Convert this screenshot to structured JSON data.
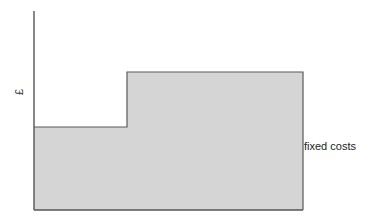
{
  "figure": {
    "background_color": "#ffffff",
    "width": 365,
    "height": 222
  },
  "axes": {
    "y_axis_label": "£",
    "x_axis_label": "",
    "axis_color": "#555555",
    "grid": "off",
    "ticks": []
  },
  "annotations": {
    "series_label": "fixed costs"
  },
  "style": {
    "fill_color": "#d5d5d5",
    "outline_color": "#5a5a5a",
    "text_color": "#1c1c1c"
  },
  "chart_data": {
    "type": "area",
    "title": "",
    "subtitle": "",
    "xlabel": "",
    "ylabel": "£",
    "grid": false,
    "legend_position": "right-inline",
    "xlim": [
      0,
      100
    ],
    "ylim": [
      0,
      100
    ],
    "step_shape": "step-up",
    "series": [
      {
        "name": "fixed costs",
        "type": "step",
        "x": [
          0,
          34.6,
          34.6,
          100
        ],
        "y": [
          41.7,
          41.7,
          69.3,
          69.3
        ],
        "segments": [
          {
            "label": "lower step",
            "x_start": 0,
            "x_end": 34.6,
            "level": 41.7
          },
          {
            "label": "upper step",
            "x_start": 34.6,
            "x_end": 100,
            "level": 69.3
          }
        ]
      }
    ],
    "annotations": [
      {
        "text": "fixed costs",
        "x": 100.5,
        "y": 31.8,
        "align": "left"
      }
    ]
  },
  "geometry_px": {
    "axis_x": 34,
    "axis_top_y": 11,
    "baseline_y": 210,
    "right_edge_x": 303,
    "step_x": 127,
    "lower_level_y": 127,
    "upper_level_y": 72
  }
}
